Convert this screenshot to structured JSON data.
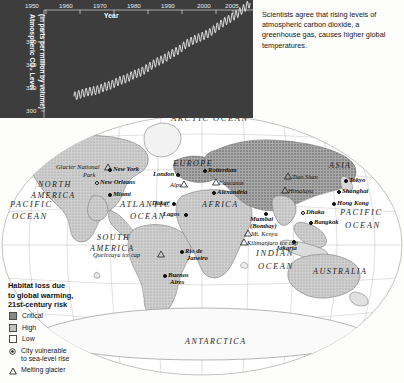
{
  "chart": {
    "xtitle": "Year",
    "ytitle_line1": "Atmospheric CO₂ Level",
    "ytitle_line2": "(in parts per million by volume)",
    "xticks": [
      "1950",
      "1960",
      "1970",
      "1980",
      "1990",
      "2000",
      "2005"
    ],
    "yticks": [
      "360",
      "340",
      "320",
      "300"
    ],
    "panel_bg": "#3d3d3d",
    "line_color": "#f2f2f2"
  },
  "chart_data": {
    "type": "line",
    "title": "",
    "xlabel": "Year",
    "ylabel": "Atmospheric CO2 Level (in parts per million by volume)",
    "xlim": [
      1950,
      2005
    ],
    "ylim": [
      300,
      375
    ],
    "grid": false,
    "legend": "none",
    "annotation": "Seasonal oscillation superimposed on rising trend (Keeling curve)",
    "xticks": [
      1950,
      1960,
      1970,
      1980,
      1990,
      2000,
      2005
    ],
    "yticks": [
      300,
      320,
      340,
      360
    ],
    "series": [
      {
        "name": "Atmospheric CO2 (ppm)",
        "x": [
          1958,
          1960,
          1962,
          1964,
          1966,
          1968,
          1970,
          1972,
          1974,
          1976,
          1978,
          1980,
          1982,
          1984,
          1986,
          1988,
          1990,
          1992,
          1994,
          1996,
          1998,
          2000,
          2002,
          2004,
          2005
        ],
        "values": [
          315,
          316.9,
          318.4,
          319.2,
          321.4,
          323.1,
          325.7,
          327.4,
          330.2,
          332.1,
          335.4,
          338.7,
          341.1,
          344.4,
          347.2,
          351.5,
          354.2,
          356.4,
          358.8,
          362.6,
          366.6,
          369.5,
          373.2,
          377.5,
          379.8
        ]
      }
    ]
  },
  "caption": {
    "text": "Scientists agree that rising levels of atmospheric carbon dioxide, a greenhouse gas, causes higher global temperatures."
  },
  "legend": {
    "title_line1": "Habitat loss due",
    "title_line2": "to global warming,",
    "title_line3": "21st-century risk",
    "swatches": [
      {
        "label": "Critical",
        "color": "#868686"
      },
      {
        "label": "High",
        "color": "#c2c2c2"
      },
      {
        "label": "Low",
        "color": "#ffffff"
      }
    ],
    "city_icon_label_line1": "City vulnerable",
    "city_icon_label_line2": "to sea-level rise",
    "glacier_icon_label": "Melting glacier"
  },
  "map": {
    "oceans": [
      {
        "name": "ARCTIC",
        "x": 171,
        "y": 119
      },
      {
        "name": "OCEAN",
        "x": 213,
        "y": 119
      },
      {
        "name": "ATLANTIC",
        "x": 123,
        "y": 205
      },
      {
        "name": "OCEAN",
        "x": 131,
        "y": 218
      },
      {
        "name": "PACIFIC",
        "x": 16,
        "y": 204
      },
      {
        "name": "OCEAN",
        "x": 18,
        "y": 217
      },
      {
        "name": "PACIFIC",
        "x": 345,
        "y": 212
      },
      {
        "name": "OCEAN",
        "x": 350,
        "y": 226
      },
      {
        "name": "INDIAN",
        "x": 262,
        "y": 253
      },
      {
        "name": "OCEAN",
        "x": 264,
        "y": 266
      }
    ],
    "continents": [
      {
        "name": "NORTH",
        "x": 43,
        "y": 185
      },
      {
        "name": "AMERICA",
        "x": 37,
        "y": 196
      },
      {
        "name": "SOUTH",
        "x": 101,
        "y": 238
      },
      {
        "name": "AMERICA",
        "x": 95,
        "y": 249
      },
      {
        "name": "EUROPE",
        "x": 177,
        "y": 164
      },
      {
        "name": "AFRICA",
        "x": 206,
        "y": 205
      },
      {
        "name": "ASIA",
        "x": 332,
        "y": 166
      },
      {
        "name": "AUSTRALIA",
        "x": 320,
        "y": 272
      },
      {
        "name": "ANTARCTICA",
        "x": 192,
        "y": 342
      }
    ],
    "cities": [
      {
        "name": "New York",
        "x": 113,
        "y": 169,
        "marker": "dot",
        "side": "right"
      },
      {
        "name": "New Orleans",
        "x": 100,
        "y": 182,
        "marker": "hollow",
        "side": "right"
      },
      {
        "name": "Miami",
        "x": 113,
        "y": 194,
        "marker": "dot",
        "side": "right"
      },
      {
        "name": "Rio de",
        "x": 185,
        "y": 251,
        "marker": "dot",
        "side": "right"
      },
      {
        "name": "Janeiro",
        "x": 189,
        "y": 258,
        "marker": "none",
        "side": "right"
      },
      {
        "name": "Buenos",
        "x": 168,
        "y": 275,
        "marker": "dot",
        "side": "right"
      },
      {
        "name": "Aires",
        "x": 172,
        "y": 282,
        "marker": "none",
        "side": "right"
      },
      {
        "name": "London",
        "x": 181,
        "y": 174,
        "marker": "none",
        "side": "left"
      },
      {
        "name": "Rotterdam",
        "x": 207,
        "y": 170,
        "marker": "hollow",
        "side": "right"
      },
      {
        "name": "Alexandria",
        "x": 216,
        "y": 192,
        "marker": "dot",
        "side": "right"
      },
      {
        "name": "Dakar",
        "x": 151,
        "y": 203,
        "marker": "dot",
        "side": "left"
      },
      {
        "name": "Lagos",
        "x": 189,
        "y": 214,
        "marker": "dot",
        "side": "left"
      },
      {
        "name": "Mumbai",
        "x": 268,
        "y": 218,
        "marker": "none",
        "side": "right"
      },
      {
        "name": "(Bombay)",
        "x": 268,
        "y": 225,
        "marker": "none",
        "side": "right"
      },
      {
        "name": "Dhaka",
        "x": 305,
        "y": 212,
        "marker": "hollow",
        "side": "right"
      },
      {
        "name": "Bangkok",
        "x": 313,
        "y": 222,
        "marker": "dot",
        "side": "right"
      },
      {
        "name": "Jakarta",
        "x": 297,
        "y": 246,
        "marker": "dot",
        "side": "left"
      },
      {
        "name": "Hong Kong",
        "x": 336,
        "y": 203,
        "marker": "dot",
        "side": "right"
      },
      {
        "name": "Shanghai",
        "x": 341,
        "y": 191,
        "marker": "dot",
        "side": "right"
      },
      {
        "name": "Tokyo",
        "x": 348,
        "y": 180,
        "marker": "dot",
        "side": "right"
      }
    ],
    "glaciers": [
      {
        "name": "Glacier National",
        "x": 59,
        "y": 167
      },
      {
        "name": "Park",
        "x": 86,
        "y": 175
      },
      {
        "name": "Alps",
        "x": 186,
        "y": 184
      },
      {
        "name": "Caucasus",
        "x": 218,
        "y": 182
      },
      {
        "name": "Tian Shan",
        "x": 291,
        "y": 176
      },
      {
        "name": "Himalaya",
        "x": 287,
        "y": 190
      },
      {
        "name": "Mt. Kenya",
        "x": 250,
        "y": 233
      },
      {
        "name": "Kilimanjaro ice cap",
        "x": 246,
        "y": 242
      },
      {
        "name": "Quelccaya ice cap",
        "x": 95,
        "y": 254
      }
    ]
  }
}
